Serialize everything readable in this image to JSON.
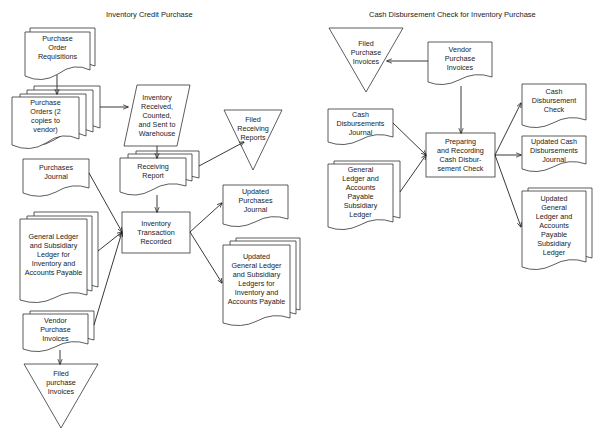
{
  "left": {
    "title": "Inventory Credit Purchase",
    "nodes": {
      "po_requisitions": "Purchase\nOrder\nRequisitions",
      "purchase_orders": "Purchase\nOrders (2\ncopies to\nvendor)",
      "inventory_received": "Inventory\nReceived,\nCounted,\nand Sent to\nWarehouse",
      "filed_receiving": "Filed\nReceiving\nReports",
      "receiving_report": "Receiving\nReport",
      "purchases_journal": "Purchases\nJournal",
      "general_ledger": "General Ledger\nand Subsidiary\nLedger for\nInventory and\nAccounts Payable",
      "transaction_recorded": "Inventory\nTransaction\nRecorded",
      "updated_purchases_journal": "Updated\nPurchases\nJournal",
      "updated_general_ledger": "Updated\nGeneral Ledger\nand Subsidiary\nLedgers for\nInventory and\nAccounts Payable",
      "vendor_invoices": "Vendor\nPurchase\nInvoices",
      "filed_invoices": "Filed\npurchase\nInvoices"
    }
  },
  "right": {
    "title": "Cash Disbursement Check for Inventory Purchase",
    "nodes": {
      "filed_invoices": "Filed\nPurchase\nInvoices",
      "vendor_invoices": "Vendor\nPurchase\nInvoices",
      "cash_journal": "Cash\nDisbursements\nJournal",
      "general_ledger": "General\nLedger and\nAccounts\nPayable\nSubsidiary\nLedger",
      "preparing": "Preparing\nand Recording\nCash Disbur-\nsement Check",
      "cash_check": "Cash\nDisbursement\nCheck",
      "updated_cash_journal": "Updated Cash\nDisbursements\nJournal",
      "updated_general_ledger": "Updated\nGeneral\nLedger and\nAccounts\nPayable\nSubsidiary\nLedger"
    }
  }
}
